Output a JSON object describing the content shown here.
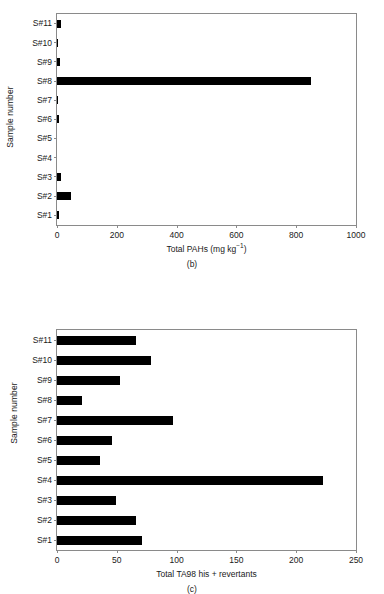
{
  "figure": {
    "background_color": "#ffffff",
    "bar_color": "#000000",
    "axis_color": "#8a8a8a"
  },
  "panels": [
    {
      "tag": "(b)",
      "ylabel": "Sample number",
      "xlabel_main": "Total PAHs (mg kg",
      "xlabel_sup": "−1",
      "xlabel_tail": ")",
      "xlabel_full": "Total PAHs (mg kg⁻¹)",
      "xticks": [
        "0",
        "200",
        "400",
        "600",
        "800",
        "1000"
      ],
      "categories": [
        "S#11",
        "S#10",
        "S#9",
        "S#8",
        "S#7",
        "S#6",
        "S#5",
        "S#4",
        "S#3",
        "S#2",
        "S#1"
      ],
      "values": [
        12,
        5,
        11,
        850,
        4,
        8,
        0,
        0,
        12,
        47,
        7
      ]
    },
    {
      "tag": "(c)",
      "ylabel": "Sample number",
      "xlabel_main": "Total TA98 his + revertants",
      "xlabel_sup": "",
      "xlabel_tail": "",
      "xlabel_full": "Total TA98 his + revertants",
      "xticks": [
        "0",
        "50",
        "100",
        "150",
        "200",
        "250"
      ],
      "categories": [
        "S#11",
        "S#10",
        "S#9",
        "S#8",
        "S#7",
        "S#6",
        "S#5",
        "S#4",
        "S#3",
        "S#2",
        "S#1"
      ],
      "values": [
        66,
        79,
        53,
        21,
        97,
        46,
        36,
        222,
        49,
        66,
        71
      ]
    }
  ],
  "chart_data": [
    {
      "type": "bar",
      "orientation": "horizontal",
      "panel": "(b)",
      "title": "",
      "xlabel": "Total PAHs (mg kg⁻¹)",
      "ylabel": "Sample number",
      "categories": [
        "S#1",
        "S#2",
        "S#3",
        "S#4",
        "S#5",
        "S#6",
        "S#7",
        "S#8",
        "S#9",
        "S#10",
        "S#11"
      ],
      "values": [
        7,
        47,
        12,
        0,
        0,
        8,
        4,
        850,
        11,
        5,
        12
      ],
      "xlim": [
        0,
        1000
      ],
      "xticks": [
        0,
        200,
        400,
        600,
        800,
        1000
      ],
      "grid": false,
      "legend": "none",
      "category_order_top_to_bottom": [
        "S#11",
        "S#10",
        "S#9",
        "S#8",
        "S#7",
        "S#6",
        "S#5",
        "S#4",
        "S#3",
        "S#2",
        "S#1"
      ]
    },
    {
      "type": "bar",
      "orientation": "horizontal",
      "panel": "(c)",
      "title": "",
      "xlabel": "Total TA98 his + revertants",
      "ylabel": "Sample number",
      "categories": [
        "S#1",
        "S#2",
        "S#3",
        "S#4",
        "S#5",
        "S#6",
        "S#7",
        "S#8",
        "S#9",
        "S#10",
        "S#11"
      ],
      "values": [
        71,
        66,
        49,
        222,
        36,
        46,
        97,
        21,
        53,
        79,
        66
      ],
      "xlim": [
        0,
        250
      ],
      "xticks": [
        0,
        50,
        100,
        150,
        200,
        250
      ],
      "grid": false,
      "legend": "none",
      "category_order_top_to_bottom": [
        "S#11",
        "S#10",
        "S#9",
        "S#8",
        "S#7",
        "S#6",
        "S#5",
        "S#4",
        "S#3",
        "S#2",
        "S#1"
      ]
    }
  ]
}
